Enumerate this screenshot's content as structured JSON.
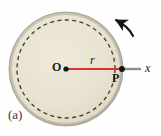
{
  "figure": {
    "panel_label": "(a)",
    "labels": {
      "center": "O",
      "point": "P",
      "radius": "r",
      "axis": "x"
    },
    "colors": {
      "disk_fill": "#e8e2d0",
      "disk_edge": "#b8b2a2",
      "disk_outline": "#a9a396",
      "dashed_circle": "#3c3a33",
      "radius_line": "#d9352a",
      "axis_line": "#8d8d8d",
      "marker": "#141414",
      "arrow": "#161616",
      "background": "#fefefe"
    },
    "geometry": {
      "center_x": 66,
      "center_y": 69,
      "disk_radius": 57,
      "dashed_radius": 49,
      "point_p_x": 122,
      "point_p_y": 69,
      "axis_end_x": 141,
      "marker_radius": 2.6
    },
    "rotation_arrow": {
      "name": "counterclockwise-rotation-arrow",
      "start_x": 133,
      "start_y": 36,
      "end_x": 115,
      "end_y": 19,
      "curve_cx": 126,
      "curve_cy": 25
    }
  }
}
